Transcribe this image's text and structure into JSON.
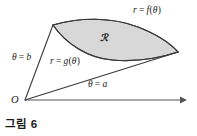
{
  "figure": {
    "caption": "그림 6",
    "background_color": "#ffffff",
    "region_fill_color": "#d8d8d8",
    "stroke_color": "#3a3a3a",
    "axis_color": "#555555",
    "labels": {
      "outer_curve": "r = f(θ)",
      "inner_curve": "r = g(θ)",
      "upper_ray": "θ = b",
      "lower_ray": "θ = a",
      "region": "ℛ",
      "origin": "O"
    },
    "label_parts": {
      "outer_curve": {
        "lhs": "r",
        "eq": "=",
        "fn": "f",
        "open": "(",
        "var": "θ",
        "close": ")"
      },
      "inner_curve": {
        "lhs": "r",
        "eq": "=",
        "fn": "g",
        "open": "(",
        "var": "θ",
        "close": ")"
      },
      "upper_ray": {
        "var": "θ",
        "eq": "=",
        "val": "b"
      },
      "lower_ray": {
        "var": "θ",
        "eq": "=",
        "val": "a"
      }
    },
    "geometry": {
      "origin": [
        25,
        100
      ],
      "left_vertex": [
        53,
        25
      ],
      "right_vertex": [
        178,
        52
      ],
      "axis_end": [
        186,
        100
      ]
    }
  }
}
